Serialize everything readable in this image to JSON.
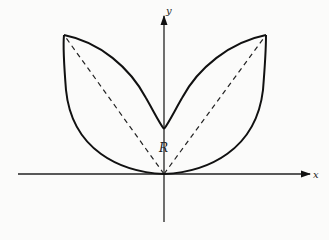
{
  "diagram": {
    "axes": {
      "x_label": "x",
      "y_label": "y"
    },
    "region_label": "R",
    "colors": {
      "stroke": "#111111",
      "background": "#fbfbfa"
    }
  }
}
